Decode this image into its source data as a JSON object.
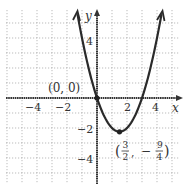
{
  "chart_data": {
    "type": "line",
    "title": "",
    "function": "y = x^2 - 3x",
    "xlabel": "x",
    "ylabel": "y",
    "xlim": [
      -6,
      5.5
    ],
    "ylim": [
      -5.7,
      5.8
    ],
    "grid": true,
    "x_ticks": [
      {
        "value": -4,
        "label": "−4"
      },
      {
        "value": -2,
        "label": "−2"
      },
      {
        "value": 2,
        "label": "2"
      },
      {
        "value": 4,
        "label": "4"
      }
    ],
    "y_ticks": [
      {
        "value": 4,
        "label": "4"
      },
      {
        "value": -2,
        "label": "−2"
      },
      {
        "value": -4,
        "label": "−4"
      }
    ],
    "series": [
      {
        "name": "parabola",
        "x": [
          -1.3,
          -1,
          -0.5,
          0,
          0.5,
          1,
          1.5,
          2,
          2.5,
          3,
          3.5,
          4,
          4.3
        ],
        "y": [
          5.59,
          4,
          1.75,
          0,
          -1.25,
          -2,
          -2.25,
          -2,
          -1.25,
          0,
          1.75,
          4,
          5.59
        ]
      }
    ],
    "annotations": [
      {
        "point": [
          0,
          0
        ],
        "label": "(0, 0)"
      },
      {
        "point": [
          1.5,
          -2.25
        ],
        "label": "(3/2, −9/4)",
        "num1": "3",
        "den1": "2",
        "num2": "9",
        "den2": "4"
      }
    ]
  },
  "labels": {
    "x_axis": "x",
    "y_axis": "y",
    "origin": "(0, 0)",
    "vertex_open": "(",
    "vertex_num1": "3",
    "vertex_den1": "2",
    "vertex_comma": ",",
    "vertex_minus": "−",
    "vertex_num2": "9",
    "vertex_den2": "4",
    "vertex_close": ")",
    "xt_m4": "−4",
    "xt_m2": "−2",
    "xt_2": "2",
    "xt_4": "4",
    "yt_4": "4",
    "yt_m2": "−2",
    "yt_m4": "−4"
  }
}
